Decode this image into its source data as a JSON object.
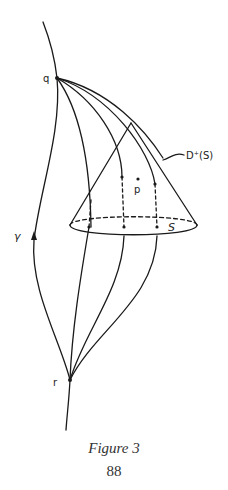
{
  "figure": {
    "caption": "Figure 3",
    "page_number": "88"
  },
  "labels": {
    "q": "q",
    "r": "r",
    "p": "p",
    "gamma": "γ",
    "surface": "S",
    "domain": "D⁺(S)"
  },
  "colors": {
    "ink": "#1a1a1a",
    "background": "#ffffff"
  }
}
